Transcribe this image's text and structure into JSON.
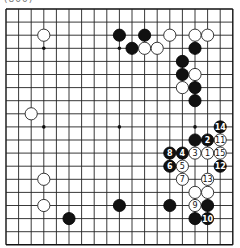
{
  "caption": "(800)",
  "board": {
    "size": 19,
    "origin_x": 6,
    "origin_y": 9,
    "step_x": 12.6,
    "step_y": 13.1,
    "stone_radius": 6.1,
    "star_points": [
      [
        3,
        3
      ],
      [
        9,
        3
      ],
      [
        15,
        3
      ],
      [
        3,
        9
      ],
      [
        9,
        9
      ],
      [
        15,
        9
      ],
      [
        3,
        15
      ],
      [
        9,
        15
      ],
      [
        15,
        15
      ]
    ],
    "stones": [
      {
        "color": "white",
        "col": 3,
        "row": 2,
        "label": ""
      },
      {
        "color": "black",
        "col": 9,
        "row": 2,
        "label": ""
      },
      {
        "color": "black",
        "col": 11,
        "row": 2,
        "label": ""
      },
      {
        "color": "white",
        "col": 13,
        "row": 2,
        "label": ""
      },
      {
        "color": "white",
        "col": 15,
        "row": 2,
        "label": ""
      },
      {
        "color": "white",
        "col": 16,
        "row": 2,
        "label": ""
      },
      {
        "color": "black",
        "col": 10,
        "row": 3,
        "label": ""
      },
      {
        "color": "white",
        "col": 11,
        "row": 3,
        "label": ""
      },
      {
        "color": "white",
        "col": 12,
        "row": 3,
        "label": ""
      },
      {
        "color": "black",
        "col": 15,
        "row": 3,
        "label": ""
      },
      {
        "color": "black",
        "col": 14,
        "row": 4,
        "label": ""
      },
      {
        "color": "black",
        "col": 14,
        "row": 5,
        "label": ""
      },
      {
        "color": "white",
        "col": 15,
        "row": 5,
        "label": ""
      },
      {
        "color": "white",
        "col": 14,
        "row": 6,
        "label": ""
      },
      {
        "color": "black",
        "col": 15,
        "row": 6,
        "label": ""
      },
      {
        "color": "black",
        "col": 15,
        "row": 7,
        "label": ""
      },
      {
        "color": "white",
        "col": 2,
        "row": 8,
        "label": ""
      },
      {
        "color": "black",
        "col": 17,
        "row": 9,
        "label": "14"
      },
      {
        "color": "black",
        "col": 15,
        "row": 10,
        "label": ""
      },
      {
        "color": "black",
        "col": 16,
        "row": 10,
        "label": "2"
      },
      {
        "color": "white",
        "col": 17,
        "row": 10,
        "label": "11"
      },
      {
        "color": "black",
        "col": 13,
        "row": 11,
        "label": "8"
      },
      {
        "color": "black",
        "col": 14,
        "row": 11,
        "label": "4"
      },
      {
        "color": "white",
        "col": 15,
        "row": 11,
        "label": "3"
      },
      {
        "color": "white",
        "col": 16,
        "row": 11,
        "label": "1"
      },
      {
        "color": "white",
        "col": 17,
        "row": 11,
        "label": "15"
      },
      {
        "color": "black",
        "col": 13,
        "row": 12,
        "label": "6"
      },
      {
        "color": "white",
        "col": 14,
        "row": 12,
        "label": "5"
      },
      {
        "color": "black",
        "col": 17,
        "row": 12,
        "label": "12"
      },
      {
        "color": "white",
        "col": 3,
        "row": 13,
        "label": ""
      },
      {
        "color": "white",
        "col": 14,
        "row": 13,
        "label": "7"
      },
      {
        "color": "white",
        "col": 16,
        "row": 13,
        "label": "13"
      },
      {
        "color": "white",
        "col": 15,
        "row": 14,
        "label": ""
      },
      {
        "color": "white",
        "col": 16,
        "row": 14,
        "label": ""
      },
      {
        "color": "white",
        "col": 3,
        "row": 15,
        "label": ""
      },
      {
        "color": "black",
        "col": 9,
        "row": 15,
        "label": ""
      },
      {
        "color": "black",
        "col": 13,
        "row": 15,
        "label": ""
      },
      {
        "color": "white",
        "col": 15,
        "row": 15,
        "label": "9"
      },
      {
        "color": "black",
        "col": 16,
        "row": 15,
        "label": ""
      },
      {
        "color": "black",
        "col": 5,
        "row": 16,
        "label": ""
      },
      {
        "color": "black",
        "col": 15,
        "row": 16,
        "label": ""
      },
      {
        "color": "black",
        "col": 16,
        "row": 16,
        "label": "10"
      }
    ]
  }
}
